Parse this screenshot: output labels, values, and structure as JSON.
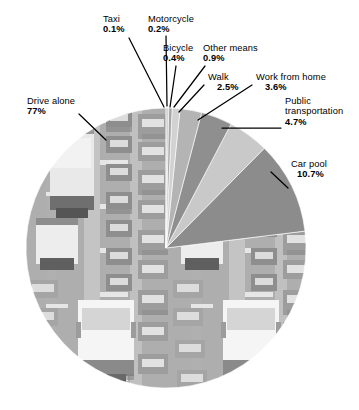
{
  "chart_data": {
    "type": "pie",
    "title": "",
    "subtitle": "",
    "xlabel": "",
    "ylabel": "",
    "legend_position": "none",
    "grid": false,
    "units": "percent",
    "categories": [
      "Drive alone",
      "Car pool",
      "Public transportation",
      "Work from home",
      "Walk",
      "Other means",
      "Bicycle",
      "Motorcycle",
      "Taxi"
    ],
    "values": [
      77,
      10.7,
      4.7,
      3.6,
      2.5,
      0.9,
      0.4,
      0.2,
      0.1
    ],
    "slices": [
      {
        "label": "Drive alone",
        "value": 77,
        "value_text": "77%",
        "color": "#9a9a9a",
        "fill": "photo-traffic"
      },
      {
        "label": "Car pool",
        "value": 10.7,
        "value_text": "10.7%",
        "color": "#8c8c8c",
        "fill": "solid"
      },
      {
        "label": "Public transportation",
        "value": 4.7,
        "value_text": "4.7%",
        "color": "#c9c9c9",
        "fill": "solid"
      },
      {
        "label": "Work from home",
        "value": 3.6,
        "value_text": "3.6%",
        "color": "#8f8f8f",
        "fill": "solid"
      },
      {
        "label": "Walk",
        "value": 2.5,
        "value_text": "2.5%",
        "color": "#b4b4b4",
        "fill": "solid"
      },
      {
        "label": "Other means",
        "value": 0.9,
        "value_text": "0.9%",
        "color": "#d2d2d2",
        "fill": "solid"
      },
      {
        "label": "Bicycle",
        "value": 0.4,
        "value_text": "0.4%",
        "color": "#a8a8a8",
        "fill": "solid"
      },
      {
        "label": "Motorcycle",
        "value": 0.2,
        "value_text": "0.2%",
        "color": "#bdbdbd",
        "fill": "solid"
      },
      {
        "label": "Taxi",
        "value": 0.1,
        "value_text": "0.1%",
        "color": "#9e9e9e",
        "fill": "solid"
      }
    ]
  },
  "labels": {
    "taxi": {
      "name": "Taxi",
      "percent": "0.1%"
    },
    "moto": {
      "name": "Motorcycle",
      "percent": "0.2%"
    },
    "bike": {
      "name": "Bicycle",
      "percent": "0.4%"
    },
    "other": {
      "name": "Other means",
      "percent": "0.9%"
    },
    "walk": {
      "name": "Walk",
      "percent": "2.5%"
    },
    "wfh": {
      "name": "Work from home",
      "percent": "3.6%"
    },
    "pubtr": {
      "name_line1": "Public",
      "name_line2": "transportation",
      "percent": "4.7%"
    },
    "drive": {
      "name": "Drive alone",
      "percent": "77%"
    },
    "carpool": {
      "name": "Car pool",
      "percent": "10.7%"
    }
  },
  "style": {
    "background": "#ffffff",
    "text_color": "#000000",
    "leader_color": "#000000"
  }
}
